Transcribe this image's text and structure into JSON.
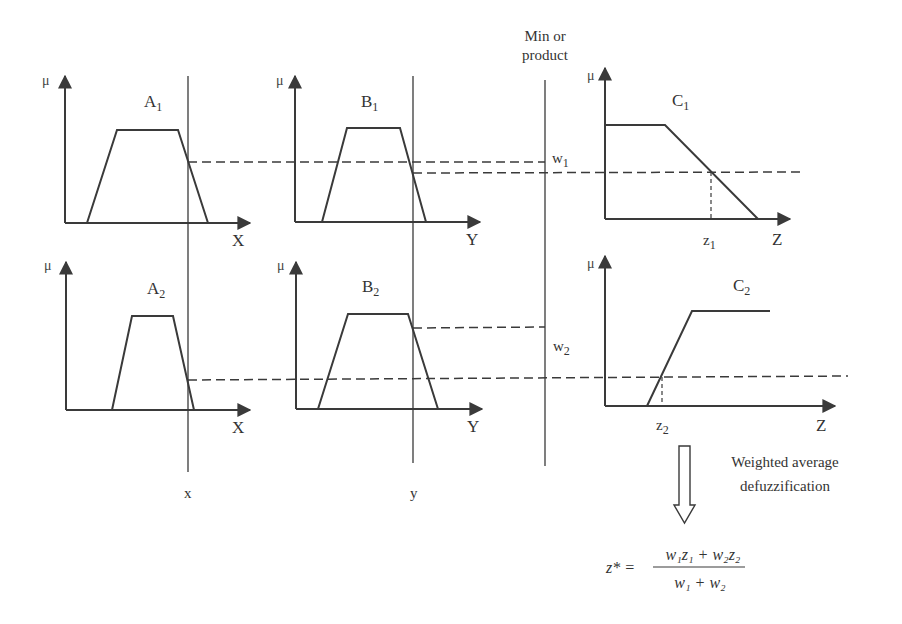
{
  "header": {
    "min_label_line1": "Min or",
    "min_label_line2": "product"
  },
  "panels": {
    "A1": {
      "name": "A",
      "sub": "1",
      "mu": "μ",
      "axis": "X"
    },
    "B1": {
      "name": "B",
      "sub": "1",
      "mu": "μ",
      "axis": "Y"
    },
    "C1": {
      "name": "C",
      "sub": "1",
      "mu": "μ",
      "axis": "Z",
      "z_name": "z",
      "z_sub": "1"
    },
    "A2": {
      "name": "A",
      "sub": "2",
      "mu": "μ",
      "axis": "X"
    },
    "B2": {
      "name": "B",
      "sub": "2",
      "mu": "μ",
      "axis": "Y"
    },
    "C2": {
      "name": "C",
      "sub": "2",
      "mu": "μ",
      "axis": "Z",
      "z_name": "z",
      "z_sub": "2"
    }
  },
  "weights": {
    "w1_name": "w",
    "w1_sub": "1",
    "w2_name": "w",
    "w2_sub": "2"
  },
  "inputs": {
    "x_label": "x",
    "y_label": "y"
  },
  "defuzz": {
    "caption_line1": "Weighted average",
    "caption_line2": "defuzzification",
    "lhs": "z* =",
    "numerator": "w₁z₁ + w₂z₂",
    "denominator": "w₁ + w₂"
  },
  "colors": {
    "line": "#3a3a3a",
    "background": "#ffffff"
  }
}
